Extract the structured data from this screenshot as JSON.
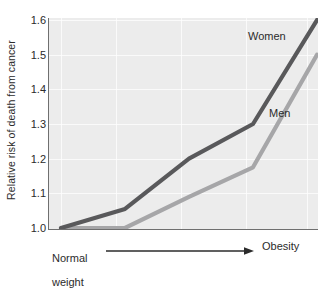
{
  "chart_data": {
    "type": "line",
    "title": "",
    "subtitle": "",
    "xlabel": "",
    "ylabel": "Relative risk of death from cancer",
    "x_axis_start_label": "Normal\nweight",
    "x_axis_end_label": "Obesity",
    "x_axis_arrow": "arrow pointing right from Normal weight to Obesity",
    "xlim": [
      0,
      4
    ],
    "ylim": [
      1.0,
      1.6
    ],
    "yticks": [
      "1.0",
      "1.1",
      "1.2",
      "1.3",
      "1.4",
      "1.5",
      "1.6"
    ],
    "ytick_values": [
      1.0,
      1.1,
      1.2,
      1.3,
      1.4,
      1.5,
      1.6
    ],
    "xticks": [],
    "grid": true,
    "grid_color": "#fdfdfd",
    "plot_background": "#ececec",
    "legend_position": "inline-annotation",
    "x": [
      0,
      1,
      2,
      3,
      4
    ],
    "series": [
      {
        "name": "Women",
        "color": "#59595b",
        "values": [
          1.0,
          1.055,
          1.2,
          1.3,
          1.6
        ]
      },
      {
        "name": "Men",
        "color": "#a6a6a8",
        "values": [
          1.0,
          1.0,
          1.09,
          1.175,
          1.5
        ]
      }
    ],
    "annotations": [
      {
        "text": "Women",
        "series": "Women",
        "x_px": 248,
        "y_px": 36
      },
      {
        "text": "Men",
        "series": "Men",
        "x_px": 269,
        "y_px": 113
      }
    ]
  },
  "axis": {
    "y_title": "Relative risk of death from cancer",
    "y_tick_labels": [
      "1.6",
      "1.5",
      "1.4",
      "1.3",
      "1.2",
      "1.1",
      "1.0"
    ],
    "x_left_label_line1": "Normal",
    "x_left_label_line2": "weight",
    "x_right_label": "Obesity"
  },
  "series_labels": {
    "women": "Women",
    "men": "Men"
  }
}
